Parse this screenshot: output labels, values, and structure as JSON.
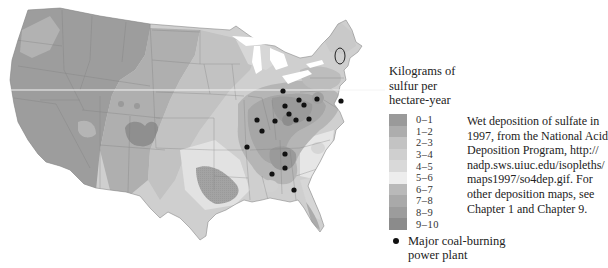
{
  "map": {
    "subject": "Wet deposition of sulfate, contiguous United States, 1997",
    "plants": [
      {
        "x": 283,
        "y": 91
      },
      {
        "x": 299,
        "y": 100
      },
      {
        "x": 304,
        "y": 105
      },
      {
        "x": 317,
        "y": 99
      },
      {
        "x": 341,
        "y": 101
      },
      {
        "x": 285,
        "y": 106
      },
      {
        "x": 289,
        "y": 114
      },
      {
        "x": 296,
        "y": 120
      },
      {
        "x": 309,
        "y": 119
      },
      {
        "x": 275,
        "y": 121
      },
      {
        "x": 257,
        "y": 120
      },
      {
        "x": 262,
        "y": 131
      },
      {
        "x": 247,
        "y": 147
      },
      {
        "x": 285,
        "y": 154
      },
      {
        "x": 285,
        "y": 168
      },
      {
        "x": 272,
        "y": 174
      },
      {
        "x": 294,
        "y": 190
      }
    ]
  },
  "legend": {
    "title_lines": [
      "Kilograms of",
      "sulfur per",
      "hectare-year"
    ],
    "classes": [
      {
        "range": "0–1",
        "color": "#9a9a9a"
      },
      {
        "range": "1–2",
        "color": "#adadad"
      },
      {
        "range": "2–3",
        "color": "#c3c3c3"
      },
      {
        "range": "3–4",
        "color": "#cfcfcf"
      },
      {
        "range": "4–5",
        "color": "#d9d9d9"
      },
      {
        "range": "5–6",
        "color": "#ededed"
      },
      {
        "range": "6–7",
        "color": "#b9b9b9"
      },
      {
        "range": "7–8",
        "color": "#a9a9a9"
      },
      {
        "range": "8–9",
        "color": "#9c9c9c"
      },
      {
        "range": "9–10",
        "color": "#8b8b8b"
      }
    ],
    "plant_label_lines": [
      "Major coal-burning",
      "power plant"
    ]
  },
  "caption": {
    "lines": [
      "Wet deposition of sulfate in",
      "1997, from the National Acid",
      "Deposition Program, http://",
      "nadp.sws.uiuc.edu/isopleths/",
      "maps1997/so4dep.gif. For",
      "other deposition maps, see",
      "Chapter 1 and Chapter 9."
    ]
  }
}
